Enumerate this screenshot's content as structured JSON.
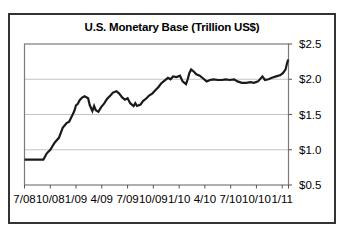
{
  "chart": {
    "title": "U.S. Monetary Base (Trillion US$)"
  },
  "chart_data": {
    "type": "line",
    "title": "U.S. Monetary Base (Trillion US$)",
    "ylabel": "Trillion US$",
    "x_unit": "months since 7/08",
    "x_tick_labels": [
      "7/08",
      "10/08",
      "1/09",
      "4/09",
      "7/09",
      "10/09",
      "1/10",
      "4/10",
      "7/10",
      "10/10",
      "1/11"
    ],
    "x_tick_months": [
      0,
      3,
      6,
      9,
      12,
      15,
      18,
      21,
      24,
      27,
      30
    ],
    "y_tick_labels": [
      "$2.5",
      "$2.0",
      "$1.5",
      "$1.0",
      "$0.5"
    ],
    "y_tick_values": [
      2.5,
      2.0,
      1.5,
      1.0,
      0.5
    ],
    "ylim": [
      0.5,
      2.5
    ],
    "grid": true,
    "legend": "none",
    "colors": {
      "line": "#1a1a1a",
      "grid": "#c3c3c3",
      "frame": "#7a7a7a",
      "axis_tick": "#555555",
      "text": "#000000",
      "background": "#ffffff",
      "border": "#333333"
    },
    "points": [
      [
        0,
        0.86
      ],
      [
        0.6,
        0.86
      ],
      [
        1.2,
        0.86
      ],
      [
        1.8,
        0.86
      ],
      [
        2.2,
        0.86
      ],
      [
        2.6,
        0.95
      ],
      [
        3.0,
        1.0
      ],
      [
        3.5,
        1.1
      ],
      [
        4.0,
        1.17
      ],
      [
        4.45,
        1.31
      ],
      [
        4.9,
        1.38
      ],
      [
        5.2,
        1.4
      ],
      [
        5.5,
        1.47
      ],
      [
        5.8,
        1.55
      ],
      [
        6.0,
        1.63
      ],
      [
        6.2,
        1.65
      ],
      [
        6.4,
        1.7
      ],
      [
        6.7,
        1.74
      ],
      [
        7.0,
        1.76
      ],
      [
        7.4,
        1.73
      ],
      [
        7.6,
        1.63
      ],
      [
        7.9,
        1.55
      ],
      [
        8.1,
        1.62
      ],
      [
        8.3,
        1.56
      ],
      [
        8.6,
        1.54
      ],
      [
        8.9,
        1.6
      ],
      [
        9.3,
        1.66
      ],
      [
        9.6,
        1.72
      ],
      [
        10.0,
        1.77
      ],
      [
        10.3,
        1.81
      ],
      [
        10.7,
        1.83
      ],
      [
        11.0,
        1.8
      ],
      [
        11.4,
        1.74
      ],
      [
        11.7,
        1.71
      ],
      [
        12.0,
        1.73
      ],
      [
        12.3,
        1.66
      ],
      [
        12.7,
        1.62
      ],
      [
        12.9,
        1.66
      ],
      [
        13.1,
        1.62
      ],
      [
        13.5,
        1.64
      ],
      [
        13.8,
        1.69
      ],
      [
        14.2,
        1.73
      ],
      [
        14.5,
        1.77
      ],
      [
        14.9,
        1.8
      ],
      [
        15.2,
        1.84
      ],
      [
        15.6,
        1.89
      ],
      [
        15.9,
        1.94
      ],
      [
        16.3,
        1.98
      ],
      [
        16.7,
        2.02
      ],
      [
        17.0,
        2.0
      ],
      [
        17.3,
        2.04
      ],
      [
        17.7,
        2.03
      ],
      [
        18.1,
        2.05
      ],
      [
        18.4,
        1.97
      ],
      [
        18.8,
        1.93
      ],
      [
        19.0,
        2.0
      ],
      [
        19.2,
        2.09
      ],
      [
        19.4,
        2.14
      ],
      [
        19.7,
        2.11
      ],
      [
        20.0,
        2.07
      ],
      [
        20.4,
        2.05
      ],
      [
        20.8,
        2.01
      ],
      [
        21.2,
        1.97
      ],
      [
        21.6,
        1.99
      ],
      [
        22.0,
        2.0
      ],
      [
        22.5,
        1.99
      ],
      [
        23.0,
        1.99
      ],
      [
        23.4,
        2.0
      ],
      [
        23.9,
        1.99
      ],
      [
        24.4,
        2.0
      ],
      [
        24.8,
        1.97
      ],
      [
        25.3,
        1.95
      ],
      [
        25.8,
        1.95
      ],
      [
        26.3,
        1.96
      ],
      [
        26.7,
        1.95
      ],
      [
        27.2,
        1.97
      ],
      [
        27.7,
        2.04
      ],
      [
        28.0,
        1.99
      ],
      [
        28.4,
        2.0
      ],
      [
        28.8,
        2.02
      ],
      [
        29.3,
        2.04
      ],
      [
        29.8,
        2.06
      ],
      [
        30.1,
        2.09
      ],
      [
        30.4,
        2.14
      ],
      [
        30.55,
        2.22
      ],
      [
        30.7,
        2.28
      ]
    ]
  }
}
